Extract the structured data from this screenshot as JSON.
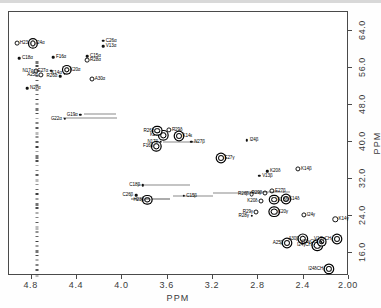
{
  "chart_data": {
    "type": "scatter",
    "title": "",
    "xlabel": "PPM",
    "ylabel": "PPM",
    "xlim": [
      5.0,
      2.0
    ],
    "ylim": [
      68.0,
      11.0
    ],
    "xticks": [
      "4.8",
      "4.4",
      "4.0",
      "3.6",
      "3.2",
      "2.8",
      "2.4",
      "2.00"
    ],
    "xtickvals": [
      4.8,
      4.4,
      4.0,
      3.6,
      3.2,
      2.8,
      2.4,
      2.0
    ],
    "yticks": [
      "16.0",
      "24.0",
      "32.0",
      "40.0",
      "48.0",
      "56.0",
      "64.0"
    ],
    "ytickvals": [
      16.0,
      24.0,
      32.0,
      40.0,
      48.0,
      56.0,
      64.0
    ],
    "grid": false,
    "legend": "none",
    "points": [
      {
        "label": "I24δCH₃",
        "x": 2.18,
        "y": 12.6,
        "side": "l",
        "size": 4.2,
        "style": "ring"
      },
      {
        "label": "A25β",
        "x": 2.55,
        "y": 18.1,
        "side": "l",
        "size": 4.0,
        "style": "ring"
      },
      {
        "label": "A30β",
        "x": 2.41,
        "y": 19.0,
        "side": "l",
        "size": 4.4,
        "style": "ring"
      },
      {
        "label": "I24γCH₃",
        "x": 2.28,
        "y": 17.6,
        "side": "l",
        "size": 4.4,
        "style": "ring"
      },
      {
        "label": "V13γCH₃",
        "x": 2.24,
        "y": 18.4,
        "side": "l",
        "size": 3.6,
        "style": "ring"
      },
      {
        "label": "V13'γCH₃",
        "x": 2.11,
        "y": 19.0,
        "side": "l",
        "size": 4.0,
        "style": "ring"
      },
      {
        "label": "K14γ",
        "x": 2.12,
        "y": 23.2,
        "side": "r",
        "size": 3.4,
        "style": "open"
      },
      {
        "label": "I24γ",
        "x": 2.4,
        "y": 24.2,
        "side": "r",
        "size": 3.2,
        "style": "open"
      },
      {
        "label": "R28γ",
        "x": 2.86,
        "y": 24.0,
        "side": "l",
        "size": 2.4,
        "style": "tiny"
      },
      {
        "label": "R29γ",
        "x": 2.82,
        "y": 24.9,
        "side": "l",
        "size": 3.0,
        "style": "open"
      },
      {
        "label": "K20γ",
        "x": 2.66,
        "y": 24.9,
        "side": "r",
        "size": 4.6,
        "style": "ring"
      },
      {
        "label": "K20δ",
        "x": 2.78,
        "y": 27.2,
        "side": "l",
        "size": 3.0,
        "style": "open"
      },
      {
        "label": "K28δ",
        "x": 2.66,
        "y": 27.5,
        "side": "r",
        "size": 3.8,
        "style": "ring"
      },
      {
        "label": "K14δ",
        "x": 2.56,
        "y": 27.6,
        "side": "r",
        "size": 4.0,
        "style": "ring"
      },
      {
        "label": "R26β",
        "x": 2.86,
        "y": 28.7,
        "side": "l",
        "size": 2.8,
        "style": "open"
      },
      {
        "label": "R29β",
        "x": 2.74,
        "y": 29.0,
        "side": "l",
        "size": 3.0,
        "style": "open"
      },
      {
        "label": "E27β",
        "x": 2.68,
        "y": 29.3,
        "side": "r",
        "size": 3.2,
        "style": "open"
      },
      {
        "label": "H23β",
        "x": 3.78,
        "y": 27.4,
        "side": "l",
        "size": 3.4,
        "style": "ring"
      },
      {
        "label": "C26β",
        "x": 3.88,
        "y": 28.5,
        "side": "l",
        "size": 2.6,
        "style": "tiny"
      },
      {
        "label": "C15β",
        "x": 3.46,
        "y": 28.3,
        "side": "r",
        "size": 2.4,
        "style": "tiny"
      },
      {
        "label": "C18β",
        "x": 3.82,
        "y": 30.6,
        "side": "l",
        "size": 2.4,
        "style": "tiny"
      },
      {
        "label": "V13β",
        "x": 2.79,
        "y": 32.6,
        "side": "r",
        "size": 2.4,
        "style": "tiny"
      },
      {
        "label": "K20δ",
        "x": 2.72,
        "y": 33.6,
        "side": "r",
        "size": 2.4,
        "style": "tiny"
      },
      {
        "label": "K14β",
        "x": 2.45,
        "y": 34.2,
        "side": "r",
        "size": 3.2,
        "style": "open"
      },
      {
        "label": "E27γ",
        "x": 3.13,
        "y": 36.4,
        "side": "r",
        "size": 4.0,
        "style": "ring"
      },
      {
        "label": "F16β",
        "x": 3.7,
        "y": 39.0,
        "side": "l",
        "size": 3.4,
        "style": "ring"
      },
      {
        "label": "N17β",
        "x": 3.66,
        "y": 40.0,
        "side": "l",
        "size": 2.6,
        "style": "tiny"
      },
      {
        "label": "N27β",
        "x": 3.39,
        "y": 40.0,
        "side": "r",
        "size": 2.4,
        "style": "tiny"
      },
      {
        "label": "I24β",
        "x": 2.9,
        "y": 40.3,
        "side": "r",
        "size": 2.4,
        "style": "tiny"
      },
      {
        "label": "K20ε",
        "x": 3.64,
        "y": 41.4,
        "side": "l",
        "size": 3.4,
        "style": "ring"
      },
      {
        "label": "K14ε",
        "x": 3.5,
        "y": 41.2,
        "side": "r",
        "size": 4.0,
        "style": "ring"
      },
      {
        "label": "R26δ",
        "x": 3.69,
        "y": 42.4,
        "side": "l",
        "size": 3.6,
        "style": "ring"
      },
      {
        "label": "R29δ",
        "x": 3.59,
        "y": 42.6,
        "side": "r",
        "size": 3.2,
        "style": "open"
      },
      {
        "label": "G22α",
        "x": 4.51,
        "y": 45.0,
        "side": "l",
        "size": 2.4,
        "style": "tiny"
      },
      {
        "label": "G19α",
        "x": 4.37,
        "y": 45.8,
        "side": "l",
        "size": 2.4,
        "style": "tiny"
      },
      {
        "label": "N27α",
        "x": 4.84,
        "y": 51.5,
        "side": "r",
        "size": 2.6,
        "style": "tiny"
      },
      {
        "label": "A25α",
        "x": 4.72,
        "y": 54.4,
        "side": "l",
        "size": 3.2,
        "style": "open"
      },
      {
        "label": "R26α",
        "x": 4.55,
        "y": 54.1,
        "side": "l",
        "size": 2.6,
        "style": "tiny"
      },
      {
        "label": "K14α",
        "x": 4.51,
        "y": 54.8,
        "side": "l",
        "size": 2.6,
        "style": "tiny"
      },
      {
        "label": "A30α",
        "x": 4.27,
        "y": 53.6,
        "side": "r",
        "size": 3.0,
        "style": "open"
      },
      {
        "label": "N17α",
        "x": 4.76,
        "y": 55.3,
        "side": "l",
        "size": 3.0,
        "style": "open"
      },
      {
        "label": "E27α",
        "x": 4.63,
        "y": 55.3,
        "side": "l",
        "size": 2.6,
        "style": "tiny"
      },
      {
        "label": "K20α",
        "x": 4.49,
        "y": 55.5,
        "side": "r",
        "size": 3.4,
        "style": "ring"
      },
      {
        "label": "C18α",
        "x": 4.91,
        "y": 58.0,
        "side": "r",
        "size": 2.6,
        "style": "tiny"
      },
      {
        "label": "F16α",
        "x": 4.61,
        "y": 58.3,
        "side": "r",
        "size": 2.6,
        "style": "tiny"
      },
      {
        "label": "R28α",
        "x": 4.31,
        "y": 57.6,
        "side": "r",
        "size": 2.8,
        "style": "open"
      },
      {
        "label": "C15α",
        "x": 4.31,
        "y": 58.4,
        "side": "r",
        "size": 2.6,
        "style": "tiny"
      },
      {
        "label": "H23α",
        "x": 4.93,
        "y": 61.2,
        "side": "r",
        "size": 2.8,
        "style": "open"
      },
      {
        "label": "I24α",
        "x": 4.79,
        "y": 61.2,
        "side": "r",
        "size": 3.2,
        "style": "ring"
      },
      {
        "label": "V13α",
        "x": 4.17,
        "y": 60.6,
        "side": "r",
        "size": 2.6,
        "style": "tiny"
      },
      {
        "label": "C26α",
        "x": 4.17,
        "y": 61.8,
        "side": "r",
        "size": 2.6,
        "style": "tiny"
      }
    ],
    "streaks": [
      {
        "x1": 3.92,
        "x2": 3.58,
        "y": 27.6,
        "weight": "thick"
      },
      {
        "x1": 3.55,
        "x2": 3.2,
        "y": 28.3,
        "weight": "thin"
      },
      {
        "x1": 3.2,
        "x2": 2.78,
        "y": 28.9,
        "weight": "thin"
      },
      {
        "x1": 3.86,
        "x2": 3.4,
        "y": 30.6,
        "weight": "thin"
      },
      {
        "x1": 3.64,
        "x2": 3.34,
        "y": 40.0,
        "weight": "thin"
      },
      {
        "x1": 4.52,
        "x2": 4.05,
        "y": 45.2,
        "weight": "thin"
      },
      {
        "x1": 4.34,
        "x2": 4.06,
        "y": 45.9,
        "weight": "thin"
      },
      {
        "x1": 2.92,
        "x2": 2.52,
        "y": 29.2,
        "weight": "thin"
      }
    ],
    "noise_column": {
      "x": 4.755,
      "y_from": 11.5,
      "y_to": 58.5
    }
  }
}
